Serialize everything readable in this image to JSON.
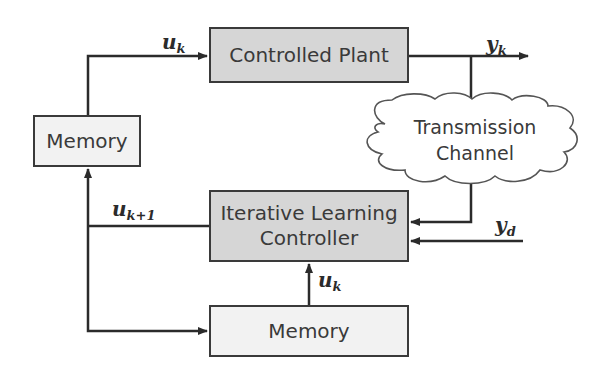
{
  "diagram": {
    "blocks": {
      "plant": "Controlled Plant",
      "memory_top": "Memory",
      "ilc_line1": "Iterative Learning",
      "ilc_line2": "Controller",
      "memory_bottom": "Memory"
    },
    "cloud": {
      "line1": "Transmission",
      "line2": "Channel"
    },
    "signals": {
      "uk_top": {
        "base": "u",
        "sub": "k"
      },
      "yk": {
        "base": "y",
        "sub": "k"
      },
      "ukp1": {
        "base": "u",
        "sub": "k+1"
      },
      "yd": {
        "base": "y",
        "sub": "d"
      },
      "uk_bottom": {
        "base": "u",
        "sub": "k"
      }
    },
    "colors": {
      "line": "#2b2b2b",
      "dark_block": "#d6d6d6",
      "light_block": "#f2f2f2"
    }
  }
}
